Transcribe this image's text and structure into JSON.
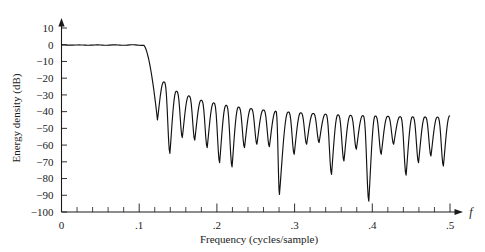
{
  "chart_data": {
    "type": "line",
    "title": "",
    "xlabel": "Frequency (cycles/sample)",
    "ylabel": "Energy density (dB)",
    "x_axis_variable": "f",
    "xlim": [
      0,
      0.5
    ],
    "ylim": [
      -100,
      10
    ],
    "grid": false,
    "legend": null,
    "x_ticks_major": [
      0,
      0.1,
      0.2,
      0.3,
      0.4,
      0.5
    ],
    "x_tick_labels": [
      "0",
      ".1",
      ".2",
      ".3",
      ".4",
      ".5"
    ],
    "x_tick_minor_step": 0.02,
    "y_ticks": [
      10,
      0,
      -10,
      -20,
      -30,
      -40,
      -50,
      -60,
      -70,
      -80,
      -90,
      -100
    ],
    "y_tick_labels": [
      "10",
      "0",
      "−10",
      "−20",
      "−30",
      "−40",
      "−50",
      "−60",
      "−70",
      "−80",
      "−90",
      "−100"
    ],
    "series": [
      {
        "name": "Energy density",
        "description": "Lowpass FIR filter energy density spectrum: flat 0 dB passband to f=0.10, sharp transition, stopband lobes from -22 dB decaying to -43 dB with deep nulls",
        "passband_level_db": 0,
        "passband_edge": 0.105,
        "first_null": 0.1235,
        "lobe_peaks": [
          {
            "f": 0.1315,
            "db": -22.2
          },
          {
            "f": 0.1475,
            "db": -27.8
          },
          {
            "f": 0.1635,
            "db": -30.6
          },
          {
            "f": 0.1795,
            "db": -33.2
          },
          {
            "f": 0.1955,
            "db": -34.8
          },
          {
            "f": 0.2115,
            "db": -36.2
          },
          {
            "f": 0.2275,
            "db": -37.3
          },
          {
            "f": 0.2435,
            "db": -38.2
          },
          {
            "f": 0.2595,
            "db": -39.0
          },
          {
            "f": 0.2755,
            "db": -39.7
          },
          {
            "f": 0.2915,
            "db": -40.2
          },
          {
            "f": 0.3075,
            "db": -40.7
          },
          {
            "f": 0.3235,
            "db": -41.1
          },
          {
            "f": 0.3395,
            "db": -41.5
          },
          {
            "f": 0.3555,
            "db": -41.9
          },
          {
            "f": 0.3715,
            "db": -42.2
          },
          {
            "f": 0.3875,
            "db": -42.4
          },
          {
            "f": 0.4035,
            "db": -42.6
          },
          {
            "f": 0.4195,
            "db": -42.8
          },
          {
            "f": 0.4355,
            "db": -43.0
          },
          {
            "f": 0.4515,
            "db": -43.1
          },
          {
            "f": 0.4675,
            "db": -43.2
          },
          {
            "f": 0.4835,
            "db": -43.3
          },
          {
            "f": 0.4995,
            "db": -42.5
          }
        ],
        "nulls": [
          {
            "f": 0.1235,
            "db": -45.0
          },
          {
            "f": 0.1395,
            "db": -65.0
          },
          {
            "f": 0.1555,
            "db": -55.5
          },
          {
            "f": 0.1715,
            "db": -57.0
          },
          {
            "f": 0.1875,
            "db": -61.5
          },
          {
            "f": 0.2035,
            "db": -70.5
          },
          {
            "f": 0.2195,
            "db": -73.0
          },
          {
            "f": 0.2355,
            "db": -61.5
          },
          {
            "f": 0.2515,
            "db": -59.5
          },
          {
            "f": 0.2675,
            "db": -61.0
          },
          {
            "f": 0.2805,
            "db": -89.5
          },
          {
            "f": 0.2995,
            "db": -65.5
          },
          {
            "f": 0.3155,
            "db": -59.5
          },
          {
            "f": 0.3315,
            "db": -58.5
          },
          {
            "f": 0.3475,
            "db": -77.5
          },
          {
            "f": 0.3635,
            "db": -69.5
          },
          {
            "f": 0.3795,
            "db": -62.5
          },
          {
            "f": 0.3955,
            "db": -93.5
          },
          {
            "f": 0.4115,
            "db": -65.5
          },
          {
            "f": 0.4275,
            "db": -59.5
          },
          {
            "f": 0.4435,
            "db": -78.0
          },
          {
            "f": 0.4595,
            "db": -70.5
          },
          {
            "f": 0.4755,
            "db": -66.5
          },
          {
            "f": 0.4915,
            "db": -72.5
          }
        ]
      }
    ]
  }
}
